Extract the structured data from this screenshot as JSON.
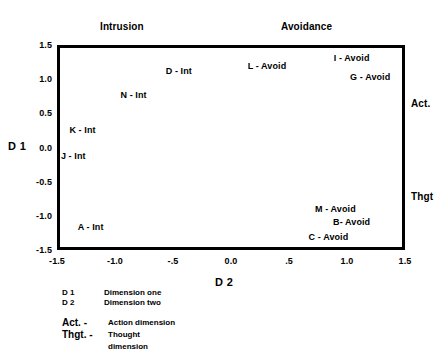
{
  "headers": {
    "left": "Intrusion",
    "right": "Avoidance"
  },
  "poles": {
    "top": "Act.",
    "bottom": "Thgt"
  },
  "axis_titles": {
    "y": "D 1",
    "x": "D 2"
  },
  "legend": {
    "rows": [
      {
        "key": "D 1",
        "desc": "Dimension one"
      },
      {
        "key": "D 2",
        "desc": "Dimension two"
      }
    ],
    "rows2": [
      {
        "key": "Act. -",
        "desc": "Action dimension"
      },
      {
        "key": "Thgt. -",
        "desc": "Thought dimension"
      }
    ]
  },
  "chart_data": {
    "type": "scatter",
    "title": "",
    "subtitle": "",
    "xlabel": "D 2",
    "ylabel": "D 1",
    "xlim": [
      -1.5,
      1.5
    ],
    "ylim": [
      -1.5,
      1.5
    ],
    "grid": false,
    "legend_position": "none",
    "xticks": [
      "-1.5",
      "-1.0",
      "-.5",
      "0.0",
      ".5",
      "1.0",
      "1.5"
    ],
    "xtick_values": [
      -1.5,
      -1.0,
      -0.5,
      0.0,
      0.5,
      1.0,
      1.5
    ],
    "yticks": [
      "1.5",
      "1.0",
      "0.5",
      "0.0",
      "-0.5",
      "-1.0",
      "-1.5"
    ],
    "ytick_values": [
      1.5,
      1.0,
      0.5,
      0.0,
      -0.5,
      -1.0,
      -1.5
    ],
    "annotations": [
      {
        "text": "Intrusion",
        "position": "top-left-quadrant-header"
      },
      {
        "text": "Avoidance",
        "position": "top-right-quadrant-header"
      },
      {
        "text": "Act.",
        "position": "right-axis-upper"
      },
      {
        "text": "Thgt",
        "position": "right-axis-lower"
      }
    ],
    "points": [
      {
        "label": "D - Int",
        "x": -0.45,
        "y": 1.12
      },
      {
        "label": "N - Int",
        "x": -0.84,
        "y": 0.77
      },
      {
        "label": "K - Int",
        "x": -1.28,
        "y": 0.25
      },
      {
        "label": "J - Int",
        "x": -1.36,
        "y": -0.13
      },
      {
        "label": "A - Int",
        "x": -1.21,
        "y": -1.16
      },
      {
        "label": "L - Avoid",
        "x": 0.31,
        "y": 1.19
      },
      {
        "label": "I - Avoid",
        "x": 1.04,
        "y": 1.31
      },
      {
        "label": "G - Avoid",
        "x": 1.2,
        "y": 1.03
      },
      {
        "label": "M - Avoid",
        "x": 0.9,
        "y": -0.9
      },
      {
        "label": "B- Avoid",
        "x": 1.04,
        "y": -1.09
      },
      {
        "label": "C - Avoid",
        "x": 0.84,
        "y": -1.31
      }
    ]
  }
}
